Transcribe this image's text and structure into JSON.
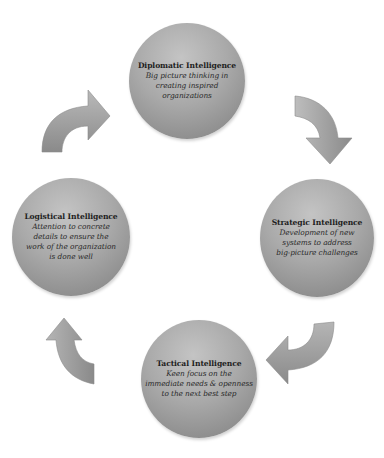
{
  "diagram": {
    "type": "cycle",
    "nodes": [
      {
        "id": "diplomatic",
        "title": "Diplomatic Intelligence",
        "desc_lines": [
          "Big picture thinking in",
          "creating inspired",
          "organizations"
        ]
      },
      {
        "id": "strategic",
        "title": "Strategic Intelligence",
        "desc_lines": [
          "Development of new",
          "systems to address",
          "big-picture challenges"
        ]
      },
      {
        "id": "tactical",
        "title": "Tactical Intelligence",
        "desc_lines": [
          "Keen focus on the",
          "immediate needs & openness",
          "to the next best step"
        ]
      },
      {
        "id": "logistical",
        "title": "Logistical Intelligence",
        "desc_lines": [
          "Attention to concrete",
          "details to ensure the",
          "work of the organization",
          "is done well"
        ]
      }
    ],
    "arrows": [
      {
        "from": "logistical",
        "to": "diplomatic",
        "icon": "curved-arrow-up-right"
      },
      {
        "from": "diplomatic",
        "to": "strategic",
        "icon": "curved-arrow-down"
      },
      {
        "from": "strategic",
        "to": "tactical",
        "icon": "curved-arrow-down-left"
      },
      {
        "from": "tactical",
        "to": "logistical",
        "icon": "curved-arrow-up"
      }
    ],
    "colors": {
      "node_fill": "#a9a9a9",
      "arrow_fill": "#9a9a9a",
      "text": "#1e1e1e"
    }
  }
}
